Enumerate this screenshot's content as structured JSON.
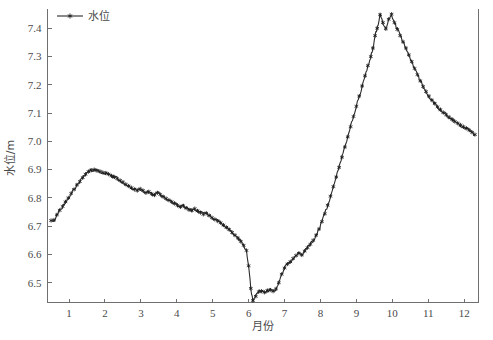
{
  "chart_data": {
    "type": "line",
    "title": "",
    "xlabel": "月份",
    "ylabel": "水位/m",
    "xlim": [
      0.4,
      12.4
    ],
    "ylim": [
      6.43,
      7.47
    ],
    "grid": false,
    "legend_position": "top-left",
    "series": [
      {
        "name": "水位",
        "marker": "star",
        "color": "#2b2b2b",
        "x": [
          0.5,
          0.58,
          0.66,
          0.74,
          0.82,
          0.9,
          0.98,
          1.06,
          1.14,
          1.22,
          1.3,
          1.38,
          1.46,
          1.54,
          1.62,
          1.7,
          1.78,
          1.86,
          1.94,
          2.02,
          2.1,
          2.18,
          2.26,
          2.34,
          2.42,
          2.5,
          2.58,
          2.66,
          2.74,
          2.82,
          2.9,
          2.98,
          3.06,
          3.14,
          3.22,
          3.3,
          3.38,
          3.46,
          3.54,
          3.62,
          3.7,
          3.78,
          3.86,
          3.94,
          4.02,
          4.1,
          4.18,
          4.26,
          4.34,
          4.42,
          4.5,
          4.58,
          4.66,
          4.74,
          4.82,
          4.9,
          4.98,
          5.06,
          5.14,
          5.22,
          5.3,
          5.38,
          5.46,
          5.54,
          5.62,
          5.7,
          5.78,
          5.86,
          5.94,
          6.0,
          6.06,
          6.12,
          6.2,
          6.28,
          6.36,
          6.44,
          6.52,
          6.6,
          6.68,
          6.76,
          6.84,
          6.92,
          7.0,
          7.08,
          7.16,
          7.24,
          7.32,
          7.4,
          7.48,
          7.56,
          7.64,
          7.72,
          7.8,
          7.88,
          7.96,
          8.04,
          8.12,
          8.2,
          8.28,
          8.36,
          8.44,
          8.52,
          8.6,
          8.68,
          8.76,
          8.84,
          8.92,
          9.0,
          9.08,
          9.16,
          9.24,
          9.32,
          9.4,
          9.46,
          9.52,
          9.58,
          9.66,
          9.74,
          9.82,
          9.9,
          9.98,
          10.06,
          10.14,
          10.22,
          10.3,
          10.38,
          10.46,
          10.54,
          10.62,
          10.7,
          10.78,
          10.86,
          10.94,
          11.02,
          11.1,
          11.18,
          11.26,
          11.34,
          11.42,
          11.5,
          11.58,
          11.66,
          11.74,
          11.82,
          11.9,
          11.98,
          12.06,
          12.14,
          12.22,
          12.3
        ],
        "y": [
          6.72,
          6.722,
          6.74,
          6.756,
          6.77,
          6.786,
          6.8,
          6.816,
          6.83,
          6.846,
          6.858,
          6.872,
          6.884,
          6.893,
          6.898,
          6.9,
          6.896,
          6.894,
          6.89,
          6.888,
          6.884,
          6.878,
          6.874,
          6.868,
          6.862,
          6.856,
          6.848,
          6.842,
          6.836,
          6.83,
          6.826,
          6.832,
          6.826,
          6.818,
          6.822,
          6.814,
          6.81,
          6.818,
          6.812,
          6.804,
          6.798,
          6.792,
          6.786,
          6.78,
          6.774,
          6.768,
          6.772,
          6.764,
          6.758,
          6.756,
          6.762,
          6.754,
          6.748,
          6.742,
          6.746,
          6.738,
          6.73,
          6.724,
          6.718,
          6.712,
          6.704,
          6.696,
          6.688,
          6.678,
          6.668,
          6.658,
          6.646,
          6.632,
          6.614,
          6.56,
          6.48,
          6.437,
          6.452,
          6.468,
          6.47,
          6.466,
          6.472,
          6.474,
          6.47,
          6.478,
          6.5,
          6.53,
          6.552,
          6.566,
          6.574,
          6.586,
          6.596,
          6.604,
          6.598,
          6.612,
          6.624,
          6.636,
          6.65,
          6.668,
          6.69,
          6.716,
          6.744,
          6.774,
          6.806,
          6.84,
          6.874,
          6.908,
          6.944,
          6.98,
          7.016,
          7.052,
          7.088,
          7.124,
          7.16,
          7.196,
          7.232,
          7.268,
          7.3,
          7.33,
          7.374,
          7.4,
          7.448,
          7.42,
          7.398,
          7.432,
          7.45,
          7.42,
          7.396,
          7.374,
          7.352,
          7.33,
          7.306,
          7.282,
          7.258,
          7.236,
          7.214,
          7.194,
          7.176,
          7.16,
          7.146,
          7.134,
          7.122,
          7.112,
          7.102,
          7.094,
          7.086,
          7.078,
          7.07,
          7.064,
          7.058,
          7.052,
          7.046,
          7.04,
          7.032,
          7.024
        ],
        "noise_amplitude": 0.006
      }
    ],
    "x_ticks": [
      1,
      2,
      3,
      4,
      5,
      6,
      7,
      8,
      9,
      10,
      11,
      12
    ],
    "x_tick_labels": [
      "1",
      "2",
      "3",
      "4",
      "5",
      "6",
      "7",
      "8",
      "9",
      "10",
      "11",
      "12"
    ],
    "y_ticks": [
      6.5,
      6.6,
      6.7,
      6.8,
      6.9,
      7.0,
      7.1,
      7.2,
      7.3,
      7.4
    ],
    "y_tick_labels": [
      "6.5",
      "6.6",
      "6.7",
      "6.8",
      "6.9",
      "7.0",
      "7.1",
      "7.2",
      "7.3",
      "7.4"
    ],
    "legend": [
      {
        "label": "水位",
        "marker": "star",
        "color": "#2b2b2b"
      }
    ]
  }
}
